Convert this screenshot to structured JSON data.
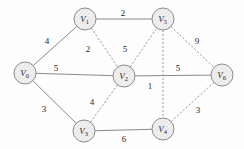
{
  "diagram": {
    "type": "undirected weighted graph",
    "colors": {
      "node_stroke": "#8d8d8d",
      "node_fill": "#ececec",
      "edge_solid": "#8a8a8a",
      "edge_dashed": "#9a9a9a",
      "label_text": "#1f1f1f",
      "background": "#fdfdfd"
    },
    "nodes": [
      {
        "id": "V0",
        "letter": "V",
        "subscript": "0",
        "cx": 25,
        "cy": 73,
        "r": 11
      },
      {
        "id": "V1",
        "letter": "V",
        "subscript": "1",
        "cx": 85,
        "cy": 19,
        "r": 11
      },
      {
        "id": "V5",
        "letter": "V",
        "subscript": "5",
        "cx": 163,
        "cy": 19,
        "r": 11
      },
      {
        "id": "V2",
        "letter": "V",
        "subscript": "2",
        "cx": 124,
        "cy": 76,
        "r": 11
      },
      {
        "id": "V6",
        "letter": "V",
        "subscript": "6",
        "cx": 222,
        "cy": 75,
        "r": 11
      },
      {
        "id": "V3",
        "letter": "V",
        "subscript": "3",
        "cx": 84,
        "cy": 131,
        "r": 11
      },
      {
        "id": "V4",
        "letter": "V",
        "subscript": "4",
        "cx": 163,
        "cy": 129,
        "r": 11
      }
    ],
    "edges": [
      {
        "from": "V0",
        "to": "V1",
        "weight": "4",
        "style": "solid",
        "label_x": 47,
        "label_y": 41
      },
      {
        "from": "V0",
        "to": "V2",
        "weight": "5",
        "style": "solid",
        "label_x": 56,
        "label_y": 68
      },
      {
        "from": "V0",
        "to": "V3",
        "weight": "3",
        "style": "solid",
        "label_x": 44,
        "label_y": 109
      },
      {
        "from": "V1",
        "to": "V5",
        "weight": "2",
        "style": "solid",
        "label_x": 123,
        "label_y": 13
      },
      {
        "from": "V1",
        "to": "V2",
        "weight": "2",
        "style": "dashed",
        "label_x": 88,
        "label_y": 49
      },
      {
        "from": "V2",
        "to": "V5",
        "weight": "5",
        "style": "dashed",
        "label_x": 125,
        "label_y": 49
      },
      {
        "from": "V5",
        "to": "V6",
        "weight": "9",
        "style": "dashed",
        "label_x": 197,
        "label_y": 41
      },
      {
        "from": "V2",
        "to": "V6",
        "weight": "5",
        "style": "solid",
        "label_x": 178,
        "label_y": 68
      },
      {
        "from": "V5",
        "to": "V4",
        "weight": "1",
        "style": "dashed",
        "label_x": 150,
        "label_y": 86
      },
      {
        "from": "V2",
        "to": "V3",
        "weight": "4",
        "style": "dashed",
        "label_x": 92,
        "label_y": 102
      },
      {
        "from": "V3",
        "to": "V4",
        "weight": "6",
        "style": "solid",
        "label_x": 124,
        "label_y": 139
      },
      {
        "from": "V4",
        "to": "V6",
        "weight": "3",
        "style": "dashed",
        "label_x": 198,
        "label_y": 110
      }
    ]
  }
}
